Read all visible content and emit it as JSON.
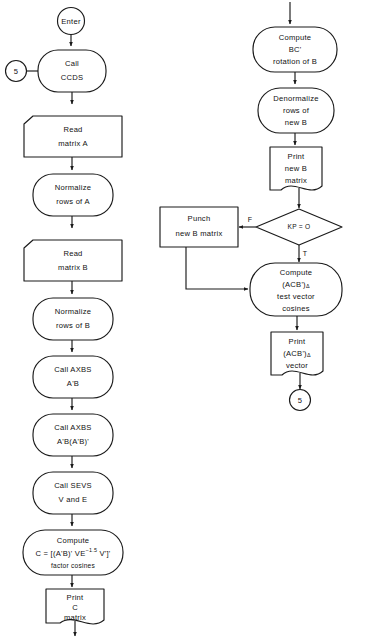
{
  "diagram": {
    "orientation": "two-column top-to-bottom flow",
    "ink_color": "#1a1a1a",
    "background_color": "#ffffff"
  },
  "left_column": {
    "terminal_enter": {
      "label": "Enter",
      "shape": "circle"
    },
    "connector_in": {
      "label": "5",
      "shape": "circle"
    },
    "nodes": [
      {
        "id": "call-ccds",
        "shape": "rounded-process",
        "lines": [
          "Call",
          "CCDS"
        ]
      },
      {
        "id": "read-matrix-a",
        "shape": "input-parallelogram",
        "lines": [
          "Read",
          "matrix A"
        ]
      },
      {
        "id": "normalize-rows-a",
        "shape": "rounded-process",
        "lines": [
          "Normalize",
          "rows of A"
        ]
      },
      {
        "id": "read-matrix-b",
        "shape": "input-parallelogram",
        "lines": [
          "Read",
          "matrix B"
        ]
      },
      {
        "id": "normalize-rows-b",
        "shape": "rounded-process",
        "lines": [
          "Normalize",
          "rows of B"
        ]
      },
      {
        "id": "call-axbs-1",
        "shape": "rounded-process",
        "lines": [
          "Call  AXBS",
          "A'B"
        ]
      },
      {
        "id": "call-axbs-2",
        "shape": "rounded-process",
        "lines": [
          "Call  AXBS",
          "A'B(A'B)'"
        ]
      },
      {
        "id": "call-sevs",
        "shape": "rounded-process",
        "lines": [
          "Call  SEVS",
          "V and E"
        ]
      },
      {
        "id": "compute-c",
        "shape": "rounded-process",
        "lines": [
          "Compute",
          "C = [(A'B)' VE^-1.5 V']'",
          "factor  cosines"
        ]
      },
      {
        "id": "print-c",
        "shape": "document",
        "lines": [
          "Print",
          "C",
          "matrix"
        ]
      }
    ]
  },
  "right_column": {
    "connector_out": {
      "label": "5",
      "shape": "circle"
    },
    "nodes": [
      {
        "id": "compute-bc",
        "shape": "rounded-process",
        "lines": [
          "Compute",
          "BC'",
          "rotation of B"
        ]
      },
      {
        "id": "denormalize",
        "shape": "rounded-process",
        "lines": [
          "Denormalize",
          "rows of",
          "new B"
        ]
      },
      {
        "id": "print-new-b",
        "shape": "document",
        "lines": [
          "Print",
          "new B",
          "matrix"
        ]
      },
      {
        "id": "decision-kp",
        "shape": "diamond",
        "lines": [
          "KP = O"
        ]
      },
      {
        "id": "punch-new-b",
        "shape": "rectangle",
        "lines": [
          "Punch",
          "new B matrix"
        ]
      },
      {
        "id": "compute-acb",
        "shape": "rounded-process",
        "lines": [
          "Compute",
          "(ACB')Δ",
          "test vector",
          "cosines"
        ]
      },
      {
        "id": "print-acb",
        "shape": "document",
        "lines": [
          "Print",
          "(ACB')Δ",
          "vector"
        ]
      }
    ]
  },
  "branch_labels": {
    "false": "F",
    "true": "T"
  },
  "formula_compute_c": {
    "prefix": "C = [(A'B)' VE",
    "exponent": "−1.5",
    "suffix": " V']'",
    "caption": "factor  cosines"
  },
  "notation": {
    "acb_base": "(ACB')",
    "acb_subscript": "Δ"
  }
}
